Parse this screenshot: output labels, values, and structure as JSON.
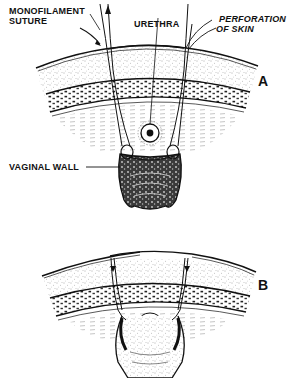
{
  "figure": {
    "colors": {
      "ink": "#111111",
      "paper": "#ffffff",
      "stipple": "#6a6a6a",
      "shade": "#2a2a2a"
    },
    "panel_a": {
      "letter": "A",
      "labels": {
        "monofilament_line1": "MONOFILAMENT",
        "monofilament_line2": "SUTURE",
        "urethra": "URETHRA",
        "perforation_line1": "PERFORATION",
        "perforation_line2": "OF SKIN",
        "vaginal_wall": "VAGINAL WALL"
      }
    },
    "panel_b": {
      "letter": "B"
    }
  }
}
